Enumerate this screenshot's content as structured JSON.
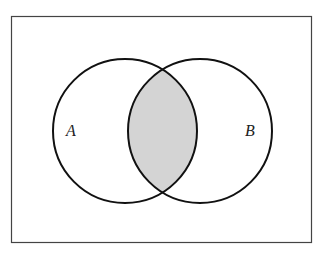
{
  "diagram": {
    "type": "venn",
    "universe": {
      "x": 11,
      "y": 16,
      "width": 301,
      "height": 227,
      "stroke": "#444444"
    },
    "sets": [
      {
        "label": "A",
        "cx": 125,
        "cy": 131,
        "r": 72
      },
      {
        "label": "B",
        "cx": 200,
        "cy": 131,
        "r": 72
      }
    ],
    "shaded_region": "A ∩ B",
    "shade_color": "#d4d4d4",
    "stroke_color": "#111111"
  }
}
